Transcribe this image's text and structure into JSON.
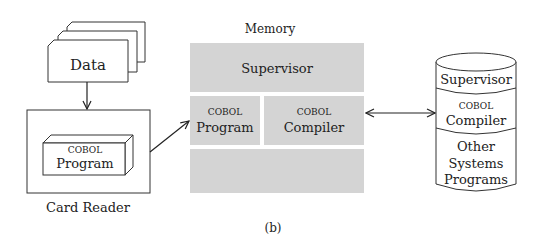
{
  "figure_label": "(b)",
  "data_cards": {
    "label": "Data"
  },
  "card_reader": {
    "label": "Card Reader",
    "program_box": {
      "line1": "COBOL",
      "line2": "Program"
    }
  },
  "memory": {
    "title": "Memory",
    "fill_color": "#d4d4d4",
    "supervisor": "Supervisor",
    "program": {
      "line1": "COBOL",
      "line2": "Program"
    },
    "compiler": {
      "line1": "COBOL",
      "line2": "Compiler"
    }
  },
  "disk": {
    "segments": [
      {
        "line1": "Supervisor"
      },
      {
        "line1": "COBOL",
        "line2": "Compiler"
      },
      {
        "line1": "Other",
        "line2": "Systems",
        "line3": "Programs"
      }
    ]
  }
}
